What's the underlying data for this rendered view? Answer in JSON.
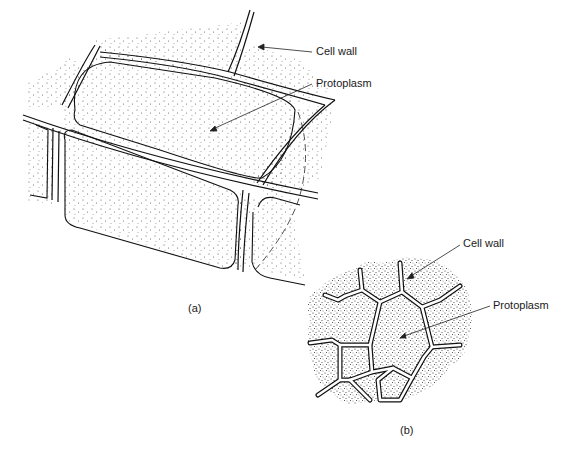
{
  "figure": {
    "panel_a": {
      "caption": "(a)",
      "labels": {
        "cell_wall": "Cell wall",
        "protoplasm": "Protoplasm"
      }
    },
    "panel_b": {
      "caption": "(b)",
      "labels": {
        "cell_wall": "Cell wall",
        "protoplasm": "Protoplasm"
      }
    }
  }
}
